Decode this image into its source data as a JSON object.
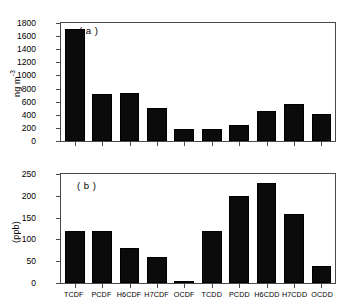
{
  "figure": {
    "background": "#ffffff",
    "bar_color": "#0b0b0b",
    "axis_color": "#4a4a4a"
  },
  "chart_data": [
    {
      "type": "bar",
      "panel_label": "( a )",
      "title": "",
      "xlabel": "",
      "ylabel": "ng m-3",
      "ylabel_display": "ng m",
      "ylabel_exponent": "-3",
      "categories": [
        "TCDF",
        "PCDF",
        "H6CDF",
        "H7CDF",
        "OCDF",
        "TCDD",
        "PCDD",
        "H6CDD",
        "H7CDD",
        "OCDD"
      ],
      "values": [
        1710,
        710,
        740,
        500,
        185,
        185,
        250,
        460,
        560,
        415
      ],
      "ylim": [
        0,
        1800
      ],
      "yticks": [
        0,
        200,
        400,
        600,
        800,
        1000,
        1200,
        1400,
        1600,
        1800
      ],
      "yticklabels": [
        "0",
        "200",
        "400",
        "600",
        "800",
        "1000",
        "1200",
        "1400",
        "1600",
        "1800"
      ],
      "grid": false,
      "legend": "none",
      "xticklabels_visible": false
    },
    {
      "type": "bar",
      "panel_label": "( b )",
      "title": "",
      "xlabel": "",
      "ylabel": "(ppb)",
      "categories": [
        "TCDF",
        "PCDF",
        "H6CDF",
        "H7CDF",
        "OCDF",
        "TCDD",
        "PCDD",
        "H6CDD",
        "H7CDD",
        "OCDD"
      ],
      "values": [
        120,
        120,
        80,
        59,
        1,
        120,
        200,
        230,
        158,
        38
      ],
      "ylim": [
        0,
        250
      ],
      "yticks": [
        0,
        50,
        100,
        150,
        200,
        250
      ],
      "yticklabels": [
        "0",
        "50",
        "100",
        "150",
        "200",
        "250"
      ],
      "grid": false,
      "legend": "none",
      "xticklabels_visible": true
    }
  ]
}
